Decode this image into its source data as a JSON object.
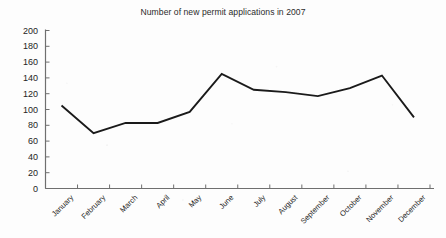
{
  "chart_data": {
    "type": "line",
    "title": "Number of new permit applications in 2007",
    "xlabel": "",
    "ylabel": "",
    "ylim": [
      0,
      200
    ],
    "ytick_step": 20,
    "yticks": [
      0,
      20,
      40,
      60,
      80,
      100,
      120,
      140,
      160,
      180,
      200
    ],
    "grid": false,
    "legend": false,
    "legend_position": "none",
    "markers": false,
    "line_color": "#1a1a1a",
    "axis_color": "#6f6f6f",
    "background_color": "#fdfdfd",
    "categories": [
      "January",
      "February",
      "March",
      "April",
      "May",
      "June",
      "July",
      "August",
      "September",
      "October",
      "November",
      "December"
    ],
    "values": [
      105,
      70,
      83,
      83,
      97,
      145,
      125,
      122,
      117,
      127,
      143,
      90
    ],
    "series": [
      {
        "name": "New permit applications",
        "values": [
          105,
          70,
          83,
          83,
          97,
          145,
          125,
          122,
          117,
          127,
          143,
          90
        ]
      }
    ]
  }
}
